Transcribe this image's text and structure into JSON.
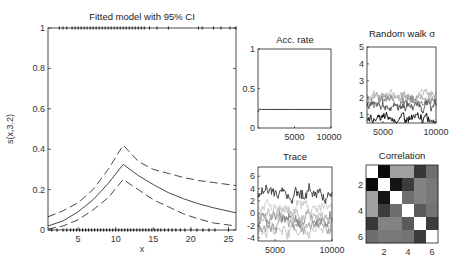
{
  "chart_data": [
    {
      "id": "fitted",
      "type": "line",
      "title": "Fitted model with 95% CI",
      "xlabel": "x",
      "ylabel": "s(x,3.2)",
      "xlim": [
        1,
        26
      ],
      "ylim": [
        0,
        1
      ],
      "xticks": [
        5,
        10,
        15,
        20,
        25
      ],
      "yticks": [
        0,
        0.2,
        0.4,
        0.6,
        0.8,
        1
      ],
      "ytick_labels": [
        "0",
        "0.2",
        "0.4",
        "0.6",
        "0.8",
        "1"
      ],
      "x": [
        1,
        3,
        5,
        7,
        9,
        11,
        13,
        15,
        17,
        19,
        21,
        23,
        26
      ],
      "series": [
        {
          "name": "fit",
          "style": "solid",
          "values": [
            0.02,
            0.045,
            0.09,
            0.15,
            0.23,
            0.325,
            0.27,
            0.225,
            0.185,
            0.155,
            0.13,
            0.11,
            0.085
          ]
        },
        {
          "name": "upper 95% CI",
          "style": "dashed",
          "values": [
            0.065,
            0.095,
            0.135,
            0.2,
            0.3,
            0.42,
            0.34,
            0.3,
            0.28,
            0.26,
            0.245,
            0.235,
            0.22
          ]
        },
        {
          "name": "lower 95% CI",
          "style": "dashed",
          "values": [
            0.005,
            0.02,
            0.05,
            0.1,
            0.16,
            0.25,
            0.2,
            0.15,
            0.115,
            0.08,
            0.055,
            0.035,
            0.02
          ]
        }
      ],
      "rug_top_x": [
        2.5,
        3,
        3.5,
        4.2,
        4.6,
        5,
        5.4,
        5.8,
        6.2,
        6.6,
        7,
        7.4,
        7.8,
        8.2,
        8.6,
        9,
        9.4,
        9.8,
        10.2,
        10.6,
        11,
        11.4,
        11.8,
        12.2,
        12.6,
        13,
        13.4,
        13.8,
        14.5,
        15.5,
        17,
        21,
        21.5,
        23,
        24,
        25.2,
        26
      ],
      "rug_bottom_x": [
        1.5,
        2.2,
        3,
        3.5,
        4,
        4.4,
        4.8,
        5.2,
        5.6,
        6,
        6.4,
        6.8,
        7.2,
        7.6,
        8,
        8.4,
        8.8,
        9.2,
        9.6,
        10,
        10.4,
        10.8,
        11.2,
        11.6,
        12,
        12.4,
        12.8,
        13.2,
        13.6,
        14,
        14.4,
        14.8,
        15.2,
        15.6,
        16,
        16.5,
        17,
        17.5,
        18,
        18.6,
        19.2,
        20,
        20.8,
        21.6,
        22.4,
        23.2,
        25
      ]
    },
    {
      "id": "acc_rate",
      "type": "line",
      "title": "Acc. rate",
      "xlim": [
        0,
        10000
      ],
      "ylim": [
        0,
        1
      ],
      "xticks": [
        5000,
        10000
      ],
      "yticks": [
        0,
        0.5,
        1
      ],
      "ytick_labels": [
        "0",
        "0.5",
        "1"
      ],
      "x": [
        0,
        200,
        500,
        1000,
        5000,
        10000
      ],
      "values": [
        0.2,
        0.24,
        0.235,
        0.235,
        0.235,
        0.235
      ]
    },
    {
      "id": "random_walk_sigma",
      "type": "line",
      "title": "Random walk σ",
      "xlim": [
        3500,
        10000
      ],
      "ylim": [
        0.5,
        5
      ],
      "xticks": [
        5000,
        10000
      ],
      "yticks": [
        1,
        2,
        3,
        4,
        5
      ],
      "series": [
        {
          "name": "σ1",
          "shade": "#111111",
          "mean": 0.75
        },
        {
          "name": "σ2",
          "shade": "#555555",
          "mean": 1.5
        },
        {
          "name": "σ3",
          "shade": "#888888",
          "mean": 1.8
        },
        {
          "name": "σ4",
          "shade": "#a8a8a8",
          "mean": 2.1
        },
        {
          "name": "σ5",
          "shade": "#c4c4c4",
          "mean": 2.2
        }
      ]
    },
    {
      "id": "trace",
      "type": "line",
      "title": "Trace",
      "xlim": [
        3500,
        10000
      ],
      "ylim": [
        -4.5,
        7.5
      ],
      "xticks": [
        5000,
        10000
      ],
      "yticks": [
        -4,
        -2,
        0,
        2,
        4,
        6
      ],
      "series": [
        {
          "name": "θ1",
          "shade": "#444444",
          "mean": 3.5
        },
        {
          "name": "θ2",
          "shade": "#cfcfcf",
          "mean": 1.0
        },
        {
          "name": "θ3",
          "shade": "#bdbdbd",
          "mean": -0.5
        },
        {
          "name": "θ4",
          "shade": "#8a8a8a",
          "mean": -0.5
        },
        {
          "name": "θ5",
          "shade": "#a0a0a0",
          "mean": -2.0
        },
        {
          "name": "θ6",
          "shade": "#c8c8c8",
          "mean": -2.5
        }
      ]
    },
    {
      "id": "correlation",
      "type": "heatmap",
      "title": "Correlation",
      "xticks": [
        2,
        4,
        6
      ],
      "yticks": [
        2,
        4,
        6
      ],
      "size": 6,
      "gray_levels": [
        [
          255,
          10,
          160,
          160,
          55,
          110
        ],
        [
          10,
          255,
          20,
          60,
          130,
          120
        ],
        [
          160,
          20,
          255,
          110,
          130,
          120
        ],
        [
          160,
          60,
          110,
          255,
          90,
          115
        ],
        [
          55,
          130,
          130,
          90,
          255,
          60
        ],
        [
          110,
          120,
          120,
          115,
          60,
          255
        ]
      ]
    }
  ]
}
